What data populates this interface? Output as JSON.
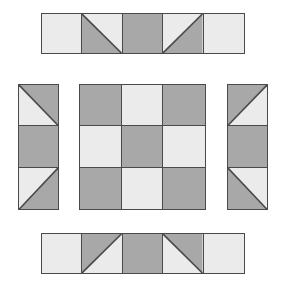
{
  "figure": {
    "background_color": "#ffffff",
    "seam_color": "#4a4a4a",
    "palette": {
      "dark": "#a8a8a8",
      "light": "#ebebeb"
    }
  },
  "units": {
    "top": {
      "name": "Top border strip",
      "orientation": "horizontal",
      "rows": 1,
      "columns": 5,
      "cells": [
        {
          "index": 1,
          "type": "solid",
          "fill": "light"
        },
        {
          "index": 2,
          "type": "triangle",
          "dark_corner": "bottom-left",
          "diagonal": "tl-br"
        },
        {
          "index": 3,
          "type": "solid",
          "fill": "dark"
        },
        {
          "index": 4,
          "type": "triangle",
          "dark_corner": "bottom-right",
          "diagonal": "bl-tr"
        },
        {
          "index": 5,
          "type": "solid",
          "fill": "light"
        }
      ]
    },
    "left": {
      "name": "Left border strip",
      "orientation": "vertical",
      "rows": 3,
      "columns": 1,
      "cells": [
        {
          "index": 1,
          "type": "triangle",
          "dark_corner": "top-right",
          "diagonal": "tl-br"
        },
        {
          "index": 2,
          "type": "solid",
          "fill": "dark"
        },
        {
          "index": 3,
          "type": "triangle",
          "dark_corner": "bottom-right",
          "diagonal": "bl-tr"
        }
      ]
    },
    "center": {
      "name": "Center nine-patch block",
      "orientation": "grid",
      "rows": 3,
      "columns": 3,
      "cells": [
        {
          "index": 1,
          "type": "solid",
          "fill": "dark"
        },
        {
          "index": 2,
          "type": "solid",
          "fill": "light"
        },
        {
          "index": 3,
          "type": "solid",
          "fill": "dark"
        },
        {
          "index": 4,
          "type": "solid",
          "fill": "light"
        },
        {
          "index": 5,
          "type": "solid",
          "fill": "dark"
        },
        {
          "index": 6,
          "type": "solid",
          "fill": "light"
        },
        {
          "index": 7,
          "type": "solid",
          "fill": "dark"
        },
        {
          "index": 8,
          "type": "solid",
          "fill": "light"
        },
        {
          "index": 9,
          "type": "solid",
          "fill": "dark"
        }
      ]
    },
    "right": {
      "name": "Right border strip",
      "orientation": "vertical",
      "rows": 3,
      "columns": 1,
      "cells": [
        {
          "index": 1,
          "type": "triangle",
          "dark_corner": "top-left",
          "diagonal": "bl-tr"
        },
        {
          "index": 2,
          "type": "solid",
          "fill": "dark"
        },
        {
          "index": 3,
          "type": "triangle",
          "dark_corner": "bottom-left",
          "diagonal": "tl-br"
        }
      ]
    },
    "bottom": {
      "name": "Bottom border strip",
      "orientation": "horizontal",
      "rows": 1,
      "columns": 5,
      "cells": [
        {
          "index": 1,
          "type": "solid",
          "fill": "light"
        },
        {
          "index": 2,
          "type": "triangle",
          "dark_corner": "top-left",
          "diagonal": "bl-tr"
        },
        {
          "index": 3,
          "type": "solid",
          "fill": "dark"
        },
        {
          "index": 4,
          "type": "triangle",
          "dark_corner": "top-right",
          "diagonal": "tl-br"
        },
        {
          "index": 5,
          "type": "solid",
          "fill": "light"
        }
      ]
    }
  }
}
